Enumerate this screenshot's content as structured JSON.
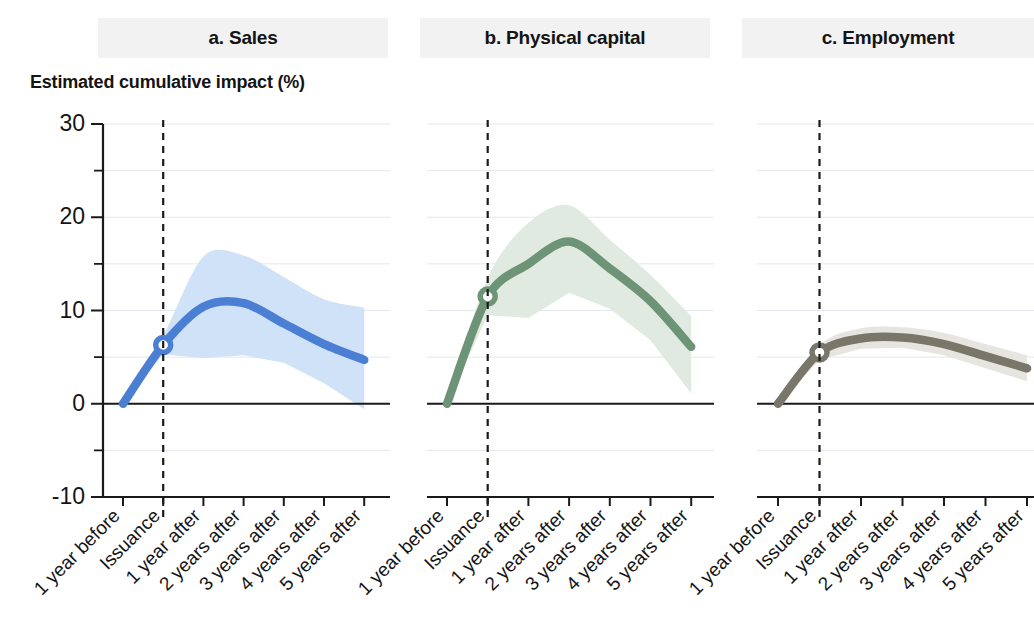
{
  "figure": {
    "y_axis_caption": "Estimated cumulative impact (%)"
  },
  "panels": [
    {
      "id": "a",
      "title": "a. Sales",
      "color": "#4a7fd4",
      "band_color": "#cfe2f7"
    },
    {
      "id": "b",
      "title": "b. Physical capital",
      "color": "#6d9477",
      "band_color": "#e0eae0"
    },
    {
      "id": "c",
      "title": "c. Employment",
      "color": "#79766a",
      "band_color": "#e6e5e0"
    }
  ],
  "axis": {
    "y_ticks_major": [
      "30",
      "20",
      "10",
      "0",
      "-10"
    ],
    "y_tick_values_major": [
      30,
      20,
      10,
      0,
      -10
    ],
    "y_tick_values_minor": [
      25,
      15,
      5,
      -5
    ],
    "y_min": -10,
    "y_max": 30,
    "x_tick_labels": [
      "1 year before",
      "Issuance",
      "1 year after",
      "2 years after",
      "3 years after",
      "4 years after",
      "5 years after"
    ],
    "event_marker_index": 1
  },
  "chart_data": {
    "type": "line",
    "title": "Estimated cumulative impact (%)",
    "xlabel": "",
    "ylabel": "Estimated cumulative impact (%)",
    "ylim": [
      -10,
      30
    ],
    "grid": true,
    "legend": "none",
    "annotations": [
      "Dashed vertical line marks the issuance date",
      "Open circle marker plots the estimate at issuance",
      "Shaded ribbon shows the confidence band around each estimate"
    ],
    "x": [
      "1 year before",
      "Issuance",
      "1 year after",
      "2 years after",
      "3 years after",
      "4 years after",
      "5 years after"
    ],
    "panels": [
      {
        "name": "a. Sales",
        "color": "#4a7fd4",
        "band_color": "#cfe2f7",
        "values": [
          0.0,
          6.3,
          10.4,
          10.8,
          8.6,
          6.4,
          4.7
        ],
        "band_upper": [
          0.0,
          7.3,
          15.8,
          15.9,
          13.6,
          11.2,
          10.3
        ],
        "band_lower": [
          0.0,
          5.3,
          4.9,
          5.2,
          4.4,
          2.2,
          -0.6
        ],
        "marker": {
          "x": "Issuance",
          "y": 6.3
        }
      },
      {
        "name": "b. Physical capital",
        "color": "#6d9477",
        "band_color": "#e0eae0",
        "values": [
          0.0,
          11.5,
          15.0,
          17.4,
          14.5,
          11.0,
          6.1
        ],
        "band_upper": [
          0.0,
          13.5,
          19.4,
          21.3,
          17.6,
          13.8,
          9.4
        ],
        "band_lower": [
          0.0,
          9.5,
          9.2,
          11.9,
          10.2,
          6.8,
          1.1
        ],
        "marker": {
          "x": "Issuance",
          "y": 11.5
        }
      },
      {
        "name": "c. Employment",
        "color": "#79766a",
        "band_color": "#e6e5e0",
        "values": [
          0.0,
          5.5,
          7.0,
          7.1,
          6.4,
          5.1,
          3.8
        ],
        "band_upper": [
          0.0,
          6.3,
          8.1,
          8.2,
          7.6,
          6.4,
          5.2
        ],
        "band_lower": [
          0.0,
          4.7,
          5.9,
          6.0,
          5.2,
          3.8,
          2.4
        ],
        "marker": {
          "x": "Issuance",
          "y": 5.5
        }
      }
    ]
  }
}
